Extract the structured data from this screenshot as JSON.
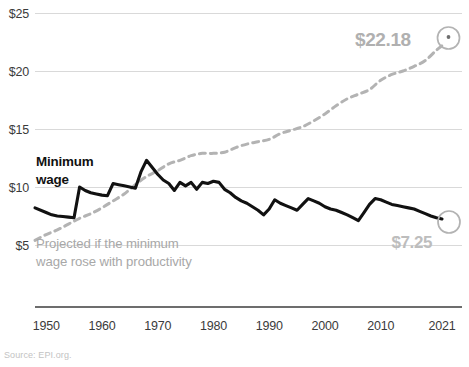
{
  "source_note": "Source: EPI.org.",
  "chart_data": {
    "type": "line",
    "title": "",
    "subtitle": "",
    "xlabel": "",
    "ylabel": "",
    "xlim": [
      1948,
      2021
    ],
    "ylim": [
      5,
      25
    ],
    "grid": true,
    "legend_position": "inline-annotation",
    "y_ticks": [
      "$5",
      "$10",
      "$15",
      "$20",
      "$25"
    ],
    "y_tick_values": [
      5,
      10,
      15,
      20,
      25
    ],
    "x_ticks": [
      "1950",
      "1960",
      "1970",
      "1980",
      "1990",
      "2000",
      "2010",
      "2021"
    ],
    "x_tick_values": [
      1950,
      1960,
      1970,
      1980,
      1990,
      2000,
      2010,
      2021
    ],
    "annotations": [
      {
        "name": "minimum-wage-label",
        "text_line1": "Minimum",
        "text_line2": "wage",
        "color": "#111111"
      },
      {
        "name": "projected-label",
        "text_line1": "Projected if the minimum",
        "text_line2": "wage rose with productivity",
        "color": "#a8a8a8"
      },
      {
        "name": "projected-end-value",
        "text": "$22.18",
        "color": "#b0b0b0",
        "value": 22.18
      },
      {
        "name": "actual-end-value",
        "text": "$7.25",
        "color": "#bdbdbd",
        "value": 7.25
      }
    ],
    "series": [
      {
        "name": "Minimum wage",
        "style": "solid",
        "color": "#111111",
        "x": [
          1948,
          1950,
          1951,
          1952,
          1953,
          1954,
          1955,
          1956,
          1957,
          1958,
          1959,
          1960,
          1961,
          1962,
          1963,
          1964,
          1965,
          1966,
          1967,
          1968,
          1969,
          1970,
          1971,
          1972,
          1973,
          1974,
          1975,
          1976,
          1977,
          1978,
          1979,
          1980,
          1981,
          1982,
          1983,
          1984,
          1985,
          1986,
          1987,
          1988,
          1989,
          1990,
          1991,
          1992,
          1993,
          1994,
          1995,
          1996,
          1997,
          1998,
          1999,
          2000,
          2001,
          2002,
          2003,
          2004,
          2005,
          2006,
          2007,
          2008,
          2009,
          2010,
          2011,
          2012,
          2013,
          2014,
          2015,
          2016,
          2017,
          2018,
          2019,
          2020,
          2021
        ],
        "y": [
          8.2,
          7.8,
          7.6,
          7.5,
          7.45,
          7.4,
          7.35,
          10.0,
          9.7,
          9.5,
          9.4,
          9.3,
          9.25,
          10.3,
          10.2,
          10.1,
          10.0,
          9.9,
          11.3,
          12.3,
          11.7,
          11.1,
          10.6,
          10.3,
          9.7,
          10.4,
          10.1,
          10.4,
          9.8,
          10.4,
          10.3,
          10.5,
          10.4,
          9.8,
          9.5,
          9.1,
          8.8,
          8.6,
          8.3,
          8.0,
          7.6,
          8.1,
          8.9,
          8.6,
          8.4,
          8.2,
          8.0,
          8.5,
          9.0,
          8.8,
          8.6,
          8.3,
          8.1,
          8.0,
          7.8,
          7.6,
          7.35,
          7.1,
          7.8,
          8.5,
          9.0,
          8.9,
          8.7,
          8.5,
          8.4,
          8.3,
          8.2,
          8.1,
          7.9,
          7.7,
          7.5,
          7.35,
          7.25
        ]
      },
      {
        "name": "Projected if the minimum wage rose with productivity",
        "style": "dashed",
        "color": "#b3b3b3",
        "x": [
          1948,
          1950,
          1952,
          1954,
          1956,
          1958,
          1960,
          1962,
          1964,
          1966,
          1968,
          1970,
          1972,
          1974,
          1976,
          1978,
          1980,
          1982,
          1984,
          1986,
          1988,
          1990,
          1992,
          1994,
          1996,
          1998,
          2000,
          2002,
          2004,
          2006,
          2008,
          2010,
          2012,
          2014,
          2016,
          2018,
          2020,
          2021
        ],
        "y": [
          5.4,
          5.9,
          6.3,
          6.8,
          7.3,
          7.7,
          8.2,
          8.8,
          9.4,
          10.2,
          10.9,
          11.4,
          12.0,
          12.3,
          12.7,
          12.9,
          12.9,
          13.0,
          13.4,
          13.7,
          13.9,
          14.1,
          14.6,
          14.9,
          15.2,
          15.7,
          16.3,
          17.0,
          17.6,
          18.0,
          18.4,
          19.2,
          19.7,
          20.0,
          20.4,
          20.9,
          21.8,
          22.18
        ]
      }
    ]
  }
}
